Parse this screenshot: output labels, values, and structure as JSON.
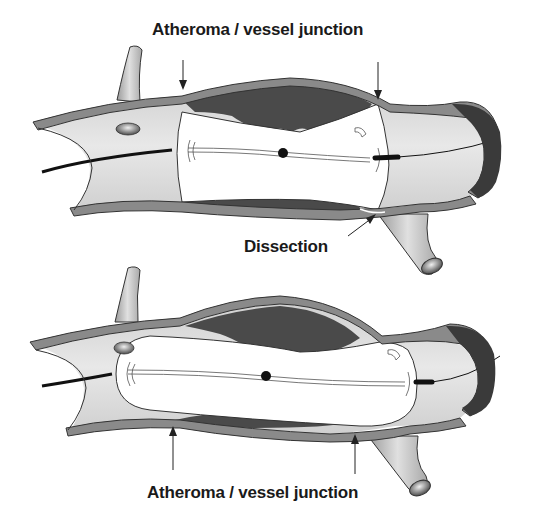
{
  "figure": {
    "panels": [
      {
        "id": "top",
        "description": "Balloon inflated within atheromatous vessel segment with dissection",
        "labels": {
          "junction": "Atheroma / vessel junction",
          "dissection": "Dissection"
        }
      },
      {
        "id": "bottom",
        "description": "Longer balloon covering atheroma / vessel junctions",
        "labels": {
          "junction": "Atheroma / vessel junction"
        }
      }
    ],
    "colors": {
      "vessel_wall": "#8a8a8a",
      "vessel_wall_outline": "#333333",
      "lumen": "#d6d6d6",
      "atheroma": "#4a4a4a",
      "balloon": "#ffffff",
      "guidewire": "#111111",
      "background": "#ffffff"
    }
  }
}
